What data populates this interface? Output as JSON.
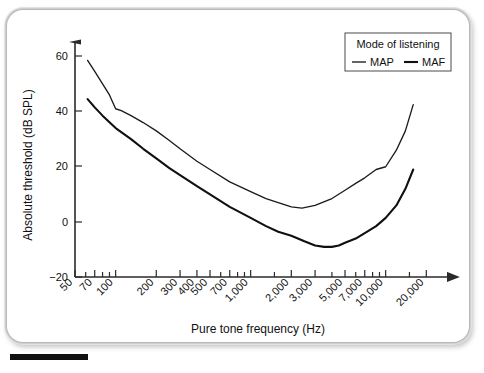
{
  "chart_data": {
    "type": "line",
    "title": "",
    "xlabel": "Pure tone frequency (Hz)",
    "ylabel": "Absolute threshold (dB SPL)",
    "xscale": "log",
    "xlim": [
      50,
      24000
    ],
    "ylim": [
      -20,
      68
    ],
    "yticks": [
      -20,
      0,
      20,
      40,
      60
    ],
    "ytick_labels": [
      "−20",
      "0",
      "20",
      "40",
      "60"
    ],
    "xticks": [
      50,
      70,
      100,
      200,
      300,
      400,
      500,
      700,
      1000,
      2000,
      3000,
      5000,
      7000,
      10000,
      20000
    ],
    "xtick_labels": [
      "50",
      "70",
      "100",
      "200",
      "300",
      "400",
      "500",
      "700",
      "1,000",
      "2,000",
      "3,000",
      "5,000",
      "7,000",
      "10,000",
      "20,000"
    ],
    "minor_xticks": [
      60,
      80,
      90,
      600,
      800,
      900,
      1500,
      4000,
      6000,
      8000,
      9000,
      15000
    ],
    "grid": false,
    "legend_position": "top-right",
    "legend_title": "Mode of listening",
    "series": [
      {
        "name": "MAP",
        "style": "thin",
        "x": [
          62,
          70,
          80,
          90,
          100,
          110,
          130,
          160,
          200,
          250,
          300,
          400,
          500,
          700,
          1000,
          1300,
          1600,
          2000,
          2400,
          3000,
          4000,
          5000,
          6000,
          7000,
          8500,
          10000,
          12000,
          14000,
          16000
        ],
        "y": [
          58.5,
          54.5,
          50.0,
          46.0,
          41.0,
          40.3,
          38.5,
          36.0,
          33.0,
          29.5,
          26.5,
          22.0,
          19.0,
          14.5,
          11.0,
          8.5,
          7.0,
          5.5,
          5.0,
          6.0,
          8.5,
          11.5,
          14.0,
          16.0,
          19.0,
          20.0,
          26.0,
          33.0,
          42.5
        ]
      },
      {
        "name": "MAF",
        "style": "thick",
        "x": [
          62,
          70,
          80,
          100,
          130,
          160,
          200,
          250,
          300,
          400,
          500,
          700,
          1000,
          1300,
          1600,
          2000,
          2500,
          3000,
          3500,
          4000,
          4500,
          5000,
          6000,
          7000,
          8500,
          10000,
          12000,
          14000,
          16000
        ],
        "y": [
          44.5,
          41.5,
          38.5,
          34.0,
          30.0,
          26.5,
          23.0,
          19.5,
          17.0,
          13.0,
          10.0,
          5.5,
          1.5,
          -1.5,
          -3.5,
          -5.0,
          -7.0,
          -8.5,
          -9.0,
          -9.0,
          -8.5,
          -7.5,
          -6.0,
          -4.0,
          -1.5,
          1.5,
          6.0,
          12.0,
          19.0
        ]
      }
    ],
    "annotations": []
  },
  "legend": {
    "title": "Mode of listening",
    "entries": [
      {
        "label": "MAP",
        "marker": "line-thin"
      },
      {
        "label": "MAF",
        "marker": "line-thick"
      }
    ]
  },
  "axes": {
    "x_title": "Pure tone frequency (Hz)",
    "y_title": "Absolute threshold (dB SPL)"
  },
  "colors": {
    "series": "#1c1c1c",
    "axis": "#2a2a2a",
    "frame": "#b9b9b9",
    "background": "#ffffff"
  }
}
